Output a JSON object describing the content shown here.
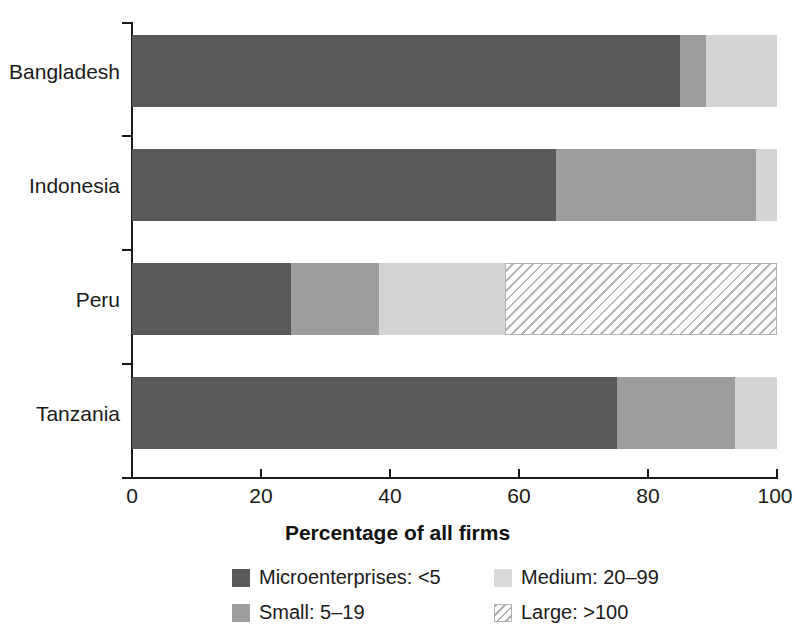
{
  "chart_data": {
    "type": "bar",
    "orientation": "horizontal",
    "stacked": true,
    "stack_mode": "percent",
    "title": "",
    "xlabel": "Percentage of all firms",
    "ylabel": "",
    "xlim": [
      0,
      100
    ],
    "xticks": [
      0,
      20,
      40,
      60,
      80,
      100
    ],
    "xtick_labels": [
      "0",
      "20",
      "40",
      "60",
      "80",
      "100"
    ],
    "grid": false,
    "legend_position": "bottom",
    "categories": [
      "Bangladesh",
      "Indonesia",
      "Peru",
      "Tanzania"
    ],
    "series": [
      {
        "name": "Microenterprises: <5",
        "color": "#595959",
        "values": [
          85.0,
          65.7,
          24.6,
          75.2
        ]
      },
      {
        "name": "Small: 5-19",
        "color": "#9d9d9d",
        "values": [
          4.0,
          31.0,
          13.7,
          18.3
        ]
      },
      {
        "name": "Medium: 20-99",
        "color": "#d4d4d4",
        "values": [
          11.0,
          3.3,
          19.5,
          6.5
        ]
      },
      {
        "name": "Large: >100",
        "color": "hatched",
        "values": [
          0.0,
          0.0,
          42.2,
          0.0
        ]
      }
    ]
  },
  "axis": {
    "x_title": "Percentage of all firms",
    "x_tick_labels": [
      "0",
      "20",
      "40",
      "60",
      "80",
      "100"
    ],
    "y_tick_labels": [
      "Bangladesh",
      "Indonesia",
      "Peru",
      "Tanzania"
    ]
  },
  "legend": {
    "items": [
      {
        "label": "Microenterprises: <5",
        "swatch": "micro"
      },
      {
        "label": "Medium: 20–99",
        "swatch": "medium"
      },
      {
        "label": "Small: 5–19",
        "swatch": "small"
      },
      {
        "label": "Large: >100",
        "swatch": "large"
      }
    ]
  },
  "colors": {
    "micro": "#595959",
    "small": "#9d9d9d",
    "medium": "#d4d4d4",
    "large_hatch": "#b8b8b8",
    "axis": "#1a1a1a",
    "background": "#ffffff"
  }
}
